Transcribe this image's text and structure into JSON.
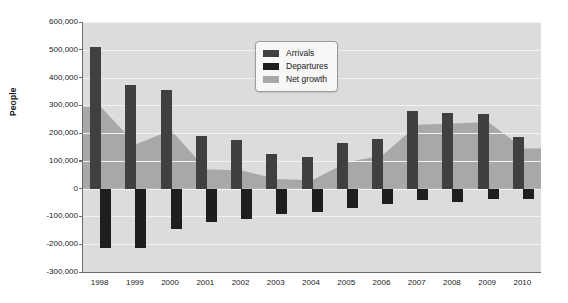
{
  "chart_data": {
    "type": "bar",
    "title": "",
    "subtitle": "",
    "xlabel": "",
    "ylabel": "People",
    "categories": [
      "1998",
      "1999",
      "2000",
      "2001",
      "2002",
      "2003",
      "2004",
      "2005",
      "2006",
      "2007",
      "2008",
      "2009",
      "2010"
    ],
    "ylim": [
      -300000,
      600000
    ],
    "ytick_values": [
      600000,
      500000,
      400000,
      300000,
      200000,
      100000,
      0,
      -100000,
      -200000,
      -300000
    ],
    "ytick_labels": [
      "600,000",
      "500,000",
      "400,000",
      "300,000",
      "200,000",
      "100,000",
      "0",
      "-100,000",
      "-200,000",
      "-300,000"
    ],
    "grid": true,
    "legend_position": "top-center",
    "series": [
      {
        "name": "Arrivals",
        "type": "bar",
        "color": "#404040",
        "values": [
          510000,
          375000,
          355000,
          190000,
          175000,
          125000,
          115000,
          165000,
          178000,
          280000,
          272000,
          268000,
          185000
        ]
      },
      {
        "name": "Departures",
        "type": "bar",
        "color": "#1e1e1e",
        "values": [
          -215000,
          -215000,
          -145000,
          -120000,
          -110000,
          -90000,
          -85000,
          -70000,
          -55000,
          -42000,
          -48000,
          -38000,
          -38000
        ]
      },
      {
        "name": "Net growth",
        "type": "area",
        "color": "#a8a8a8",
        "values": [
          295000,
          160000,
          210000,
          70000,
          65000,
          35000,
          30000,
          95000,
          120000,
          230000,
          235000,
          240000,
          145000
        ]
      }
    ]
  },
  "legend": {
    "items": [
      {
        "label": "Arrivals",
        "color": "#404040"
      },
      {
        "label": "Departures",
        "color": "#1e1e1e"
      },
      {
        "label": "Net growth",
        "color": "#a8a8a8"
      }
    ]
  }
}
